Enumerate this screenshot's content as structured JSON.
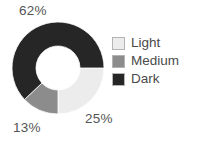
{
  "chart_data": {
    "type": "pie",
    "variant": "donut",
    "title": "",
    "xlabel": "",
    "ylabel": "",
    "grid": false,
    "legend_position": "right",
    "start_angle_deg": 90,
    "direction": "clockwise",
    "hole_fraction": 0.48,
    "categories": [
      "Light",
      "Medium",
      "Dark"
    ],
    "values": [
      25,
      13,
      62
    ],
    "value_unit": "%",
    "data_labels": [
      "25%",
      "13%",
      "62%"
    ],
    "colors": [
      "#ECECEC",
      "#8C8C8C",
      "#262626"
    ],
    "slices": [
      {
        "label": "Light",
        "value": 25,
        "data_label": "25%",
        "color": "#ECECEC",
        "start_deg": 90,
        "end_deg": 180
      },
      {
        "label": "Medium",
        "value": 13,
        "data_label": "13%",
        "color": "#8C8C8C",
        "start_deg": 180,
        "end_deg": 226.8
      },
      {
        "label": "Dark",
        "value": 62,
        "data_label": "62%",
        "color": "#262626",
        "start_deg": 226.8,
        "end_deg": 450
      }
    ]
  },
  "labels": {
    "top_left": "62%",
    "bottom_right": "25%",
    "bottom_left": "13%"
  },
  "legend": {
    "items": [
      {
        "label": "Light",
        "color": "#ECECEC"
      },
      {
        "label": "Medium",
        "color": "#8C8C8C"
      },
      {
        "label": "Dark",
        "color": "#262626"
      }
    ]
  },
  "style": {
    "background": "#ffffff",
    "text_color": "#4a4a4a",
    "label_color": "#555555",
    "swatch_border": "#b4b4b4",
    "slice_border": "#ffffff"
  },
  "geometry": {
    "center_x": 58,
    "center_y": 68,
    "outer_radius": 46,
    "inner_radius": 22
  }
}
